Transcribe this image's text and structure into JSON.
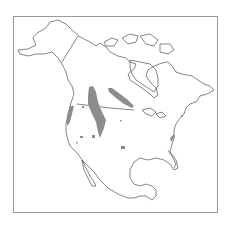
{
  "map": {
    "type": "species-range-map",
    "region": "North America",
    "colors": {
      "background": "#ffffff",
      "outline": "#333333",
      "frame": "#9a9a9a",
      "range_fill": "#8c8c8c"
    },
    "range_areas": [
      "Pacific Northwest coast strip",
      "Interior northern Rockies / Alberta-Montana band",
      "Saskatchewan-Manitoba diagonal band",
      "Scattered western US patches",
      "Southern Plains patch",
      "Virginia / mid-Atlantic patch"
    ]
  }
}
